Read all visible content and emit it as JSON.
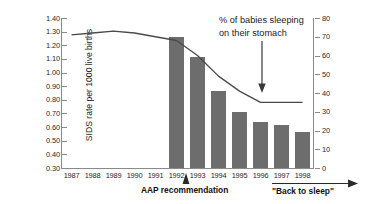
{
  "chart_data": {
    "type": "bar",
    "title": "",
    "subtitle": "",
    "categories": [
      "1987",
      "1988",
      "1989",
      "1990",
      "1991",
      "1992",
      "1993",
      "1994",
      "1995",
      "1996",
      "1997",
      "1998"
    ],
    "xlabel": "",
    "ylabel": "SIDS rate per 1000 live births",
    "ylabel_right": "",
    "ylim": [
      0.3,
      1.4
    ],
    "ylim_right": [
      0,
      80
    ],
    "grid": false,
    "legend_position": "none",
    "series": [
      {
        "name": "SIDS rate per 1000 live births",
        "type": "bar",
        "axis": "right",
        "color": "#6d6d6d",
        "categories": [
          "1987",
          "1988",
          "1989",
          "1990",
          "1991",
          "1992",
          "1993",
          "1994",
          "1995",
          "1996",
          "1997",
          "1998"
        ],
        "values": [
          null,
          null,
          null,
          null,
          null,
          70,
          59,
          41,
          30,
          24.5,
          23,
          19
        ]
      },
      {
        "name": "% of babies sleeping on their stomach",
        "type": "line",
        "axis": "right",
        "color": "#4a4a4a",
        "categories": [
          "1987",
          "1988",
          "1989",
          "1990",
          "1991",
          "1992",
          "1993",
          "1994",
          "1995",
          "1996",
          "1997",
          "1998"
        ],
        "values": [
          71,
          72,
          73,
          72,
          70,
          68,
          60,
          49,
          41,
          35,
          35,
          35
        ]
      }
    ],
    "yticks_left": [
      "1.40",
      "1.30",
      "1.20",
      "1.10",
      "1.00",
      "0.90",
      "0.80",
      "0.70",
      "0.60",
      "0.50",
      "0.40",
      "0.30"
    ],
    "yticks_right": [
      "80",
      "70",
      "60",
      "50",
      "40",
      "30",
      "20",
      "10",
      "0"
    ],
    "annotations": [
      {
        "id": "stomach-sleeping-annotation",
        "line1": "% of babies sleeping",
        "line2": "on their stomach",
        "arrow": "down"
      },
      {
        "id": "aap-recommendation-marker",
        "text": "AAP recommendation",
        "marker": "up-arrow",
        "year": "1992"
      },
      {
        "id": "back-to-sleep-campaign",
        "text": "\"Back to sleep\"",
        "marker": "right-arrow",
        "span": [
          "1995",
          "1998"
        ]
      }
    ]
  }
}
